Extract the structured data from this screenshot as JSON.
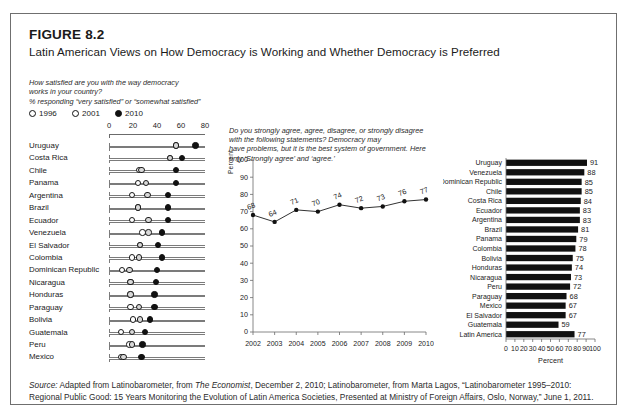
{
  "figure": {
    "number": "FIGURE 8.2",
    "title": "Latin American Views on How Democracy is Working and Whether Democracy is Preferred",
    "source_label": "Source:",
    "source_text_1": " Adapted from Latinobarometer, from ",
    "source_italic_1": "The Economist",
    "source_text_2": ", December 2, 2010; Latinobarometer, from Marta Lagos, “Latinobarometer 1995–2010: Regional Public Good: 15 Years Monitoring the Evolution of Latin America Societies, Presented at Ministry of Foreign Affairs, Oslo, Norway,” June 1, 2011."
  },
  "panel_a": {
    "question_line_1": "How satisfied are you with the way democracy",
    "question_line_2": "works in your country?",
    "subtitle": "% responding “very satisfied” or “somewhat satisfied”",
    "legend": [
      {
        "label": "1996",
        "marker": "open-circle-marker"
      },
      {
        "label": "2001",
        "marker": "open-circle-marker"
      },
      {
        "label": "2010",
        "marker": "filled-circle-marker"
      }
    ],
    "axis_ticks": [
      "0",
      "20",
      "40",
      "60",
      "80"
    ],
    "axis_min": 0,
    "axis_max": 80,
    "rows": [
      {
        "country": "Uruguay",
        "v1996": 56,
        "v2001": 56,
        "v2010": 72
      },
      {
        "country": "Costa Rica",
        "v1996": 51,
        "v2001": 51,
        "v2010": 61
      },
      {
        "country": "Chile",
        "v1996": 25,
        "v2001": 27,
        "v2010": 56
      },
      {
        "country": "Panama",
        "v1996": 24,
        "v2001": 31,
        "v2010": 56
      },
      {
        "country": "Argentina",
        "v1996": 19,
        "v2001": 32,
        "v2010": 49
      },
      {
        "country": "Brazil",
        "v1996": 24,
        "v2001": 24,
        "v2010": 49
      },
      {
        "country": "Ecuador",
        "v1996": 19,
        "v2001": 33,
        "v2010": 49
      },
      {
        "country": "Venezuela",
        "v1996": 28,
        "v2001": 33,
        "v2010": 44
      },
      {
        "country": "El Salvador",
        "v1996": 26,
        "v2001": 26,
        "v2010": 41
      },
      {
        "country": "Colombia",
        "v1996": 19,
        "v2001": 25,
        "v2010": 44
      },
      {
        "country": "Dominican Republic",
        "v1996": 11,
        "v2001": 17,
        "v2010": 40
      },
      {
        "country": "Nicaragua",
        "v1996": 18,
        "v2001": 18,
        "v2010": 39
      },
      {
        "country": "Honduras",
        "v1996": 18,
        "v2001": 18,
        "v2010": 38
      },
      {
        "country": "Paraguay",
        "v1996": 18,
        "v2001": 25,
        "v2010": 38
      },
      {
        "country": "Bolivia",
        "v1996": 20,
        "v2001": 26,
        "v2010": 34
      },
      {
        "country": "Guatemala",
        "v1996": 10,
        "v2001": 19,
        "v2010": 30
      },
      {
        "country": "Peru",
        "v1996": 17,
        "v2001": 19,
        "v2010": 28
      },
      {
        "country": "Mexico",
        "v1996": 10,
        "v2001": 12,
        "v2010": 27
      }
    ]
  },
  "panel_b": {
    "question_line_1": "Do you strongly agree, agree, disagree, or strongly disagree with the following statements? Democracy may",
    "question_line_2": "have problems, but it is the best system of government. Here only ‘Strongly agree’ and ‘agree.’"
  },
  "panel_c": {},
  "chart_data": [
    {
      "id": "democracy-best-system-trend",
      "type": "line",
      "title": "",
      "xlabel": "",
      "ylabel": "Percent",
      "ylim": [
        0,
        100
      ],
      "yticks": [
        0,
        10,
        20,
        30,
        40,
        50,
        60,
        70,
        80,
        90,
        100
      ],
      "grid": false,
      "x": [
        "2002",
        "2003",
        "2004",
        "2005",
        "2006",
        "2007",
        "2008",
        "2009",
        "2010"
      ],
      "values": [
        68,
        64,
        71,
        70,
        74,
        72,
        73,
        76,
        77
      ],
      "point_labels": [
        "68",
        "64",
        "71",
        "70",
        "74",
        "72",
        "73",
        "76",
        "77"
      ],
      "legend_position": "none"
    },
    {
      "id": "democracy-preferred-by-country",
      "type": "bar",
      "orientation": "horizontal",
      "title": "",
      "xlabel": "Percent",
      "ylabel": "",
      "xlim": [
        0,
        100
      ],
      "xticks": [
        0,
        10,
        20,
        30,
        40,
        50,
        60,
        70,
        80,
        90,
        100
      ],
      "grid": false,
      "categories": [
        "Uruguay",
        "Venezuela",
        "Dominican Republic",
        "Chile",
        "Costa Rica",
        "Ecuador",
        "Argentina",
        "Brazil",
        "Panama",
        "Colombia",
        "Bolivia",
        "Honduras",
        "Nicaragua",
        "Peru",
        "Paraguay",
        "Mexico",
        "El Salvador",
        "Guatemala",
        "Latin America"
      ],
      "values": [
        91,
        88,
        85,
        85,
        84,
        83,
        83,
        81,
        79,
        78,
        75,
        74,
        73,
        72,
        68,
        67,
        67,
        59,
        77
      ],
      "value_labels": [
        "91",
        "88",
        "85",
        "85",
        "84",
        "83",
        "83",
        "81",
        "79",
        "78",
        "75",
        "74",
        "73",
        "72",
        "68",
        "67",
        "67",
        "59",
        "77"
      ],
      "legend_position": "none"
    },
    {
      "id": "democracy-satisfaction-dotplot",
      "type": "scatter",
      "title": "% responding “very satisfied” or “somewhat satisfied”",
      "xlabel": "",
      "ylabel": "",
      "xlim": [
        0,
        80
      ],
      "xticks": [
        0,
        20,
        40,
        60,
        80
      ],
      "grid": false,
      "categories": [
        "Uruguay",
        "Costa Rica",
        "Chile",
        "Panama",
        "Argentina",
        "Brazil",
        "Ecuador",
        "Venezuela",
        "El Salvador",
        "Colombia",
        "Dominican Republic",
        "Nicaragua",
        "Honduras",
        "Paraguay",
        "Bolivia",
        "Guatemala",
        "Peru",
        "Mexico"
      ],
      "series": [
        {
          "name": "1996",
          "values": [
            56,
            51,
            25,
            24,
            19,
            24,
            19,
            28,
            26,
            19,
            11,
            18,
            18,
            18,
            20,
            10,
            17,
            10
          ]
        },
        {
          "name": "2001",
          "values": [
            56,
            51,
            27,
            31,
            32,
            24,
            33,
            33,
            26,
            25,
            17,
            18,
            18,
            25,
            26,
            19,
            19,
            12
          ]
        },
        {
          "name": "2010",
          "values": [
            72,
            61,
            56,
            56,
            49,
            49,
            49,
            44,
            41,
            44,
            40,
            39,
            38,
            38,
            34,
            30,
            28,
            27
          ]
        }
      ],
      "legend_position": "top-left"
    }
  ]
}
